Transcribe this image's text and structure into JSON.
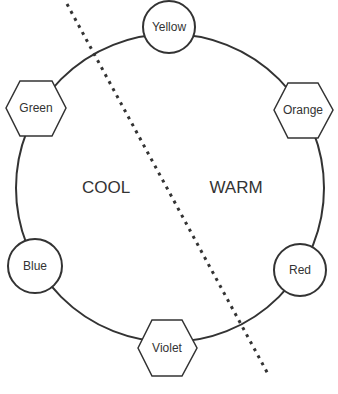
{
  "diagram": {
    "regions": {
      "cool": "COOL",
      "warm": "WARM"
    },
    "nodes": [
      {
        "label": "Yellow",
        "shape": "circle",
        "side": "warm"
      },
      {
        "label": "Orange",
        "shape": "hexagon",
        "side": "warm"
      },
      {
        "label": "Red",
        "shape": "circle",
        "side": "warm"
      },
      {
        "label": "Violet",
        "shape": "hexagon",
        "side": "cool"
      },
      {
        "label": "Blue",
        "shape": "circle",
        "side": "cool"
      },
      {
        "label": "Green",
        "shape": "hexagon",
        "side": "cool"
      }
    ],
    "colors": {
      "stroke": "#333333",
      "text": "#333333",
      "background": "#ffffff"
    }
  }
}
